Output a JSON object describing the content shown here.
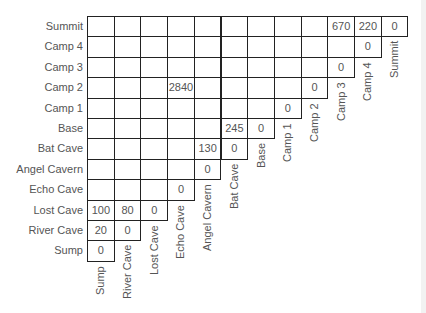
{
  "table": {
    "type": "triangular-distance-table",
    "row_labels_top_to_bottom": [
      "Summit",
      "Camp 4",
      "Camp 3",
      "Camp 2",
      "Camp 1",
      "Base",
      "Bat Cave",
      "Angel Cavern",
      "Echo Cave",
      "Lost Cave",
      "River Cave",
      "Sump"
    ],
    "column_labels_left_to_right": [
      "Sump",
      "River Cave",
      "Lost Cave",
      "Echo Cave",
      "Angel Cavern",
      "Bat Cave",
      "Base",
      "Camp 1",
      "Camp 2",
      "Camp 3",
      "Camp 4",
      "Summit"
    ],
    "rows": [
      {
        "label": "Summit",
        "cells": [
          "",
          "",
          "",
          "",
          "",
          "",
          "",
          "",
          "",
          "670",
          "220",
          "0"
        ]
      },
      {
        "label": "Camp 4",
        "cells": [
          "",
          "",
          "",
          "",
          "",
          "",
          "",
          "",
          "",
          "",
          "0"
        ]
      },
      {
        "label": "Camp 3",
        "cells": [
          "",
          "",
          "",
          "",
          "",
          "",
          "",
          "",
          "",
          "0"
        ]
      },
      {
        "label": "Camp 2",
        "cells": [
          "",
          "",
          "",
          "2840",
          "",
          "",
          "",
          "",
          "0"
        ]
      },
      {
        "label": "Camp 1",
        "cells": [
          "",
          "",
          "",
          "",
          "",
          "",
          "",
          "0"
        ]
      },
      {
        "label": "Base",
        "cells": [
          "",
          "",
          "",
          "",
          "",
          "245",
          "0"
        ]
      },
      {
        "label": "Bat Cave",
        "cells": [
          "",
          "",
          "",
          "",
          "130",
          "0"
        ]
      },
      {
        "label": "Angel Cavern",
        "cells": [
          "",
          "",
          "",
          "",
          "0"
        ]
      },
      {
        "label": "Echo Cave",
        "cells": [
          "",
          "",
          "",
          "0"
        ]
      },
      {
        "label": "Lost Cave",
        "cells": [
          "100",
          "80",
          "0"
        ]
      },
      {
        "label": "River Cave",
        "cells": [
          "20",
          "0"
        ]
      },
      {
        "label": "Sump",
        "cells": [
          "0"
        ]
      }
    ]
  },
  "style": {
    "grid_color": "#222222",
    "text_color": "#555555",
    "side_strip_color": "#f2f2f2"
  }
}
